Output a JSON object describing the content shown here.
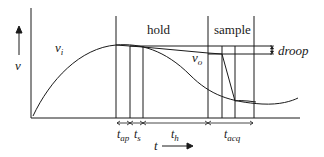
{
  "diagram": {
    "axes": {
      "y_label": "v",
      "x_label": "t"
    },
    "regions": {
      "hold": "hold",
      "sample": "sample"
    },
    "signals": {
      "input": "v",
      "input_sub": "i",
      "output": "v",
      "output_sub": "o"
    },
    "annotations": {
      "droop": "droop"
    },
    "intervals": [
      {
        "main": "t",
        "sub": "ap"
      },
      {
        "main": "t",
        "sub": "s"
      },
      {
        "main": "t",
        "sub": "h"
      },
      {
        "main": "t",
        "sub": "acq"
      }
    ],
    "colors": {
      "line": "#1a1a1a",
      "background": "#ffffff"
    }
  }
}
